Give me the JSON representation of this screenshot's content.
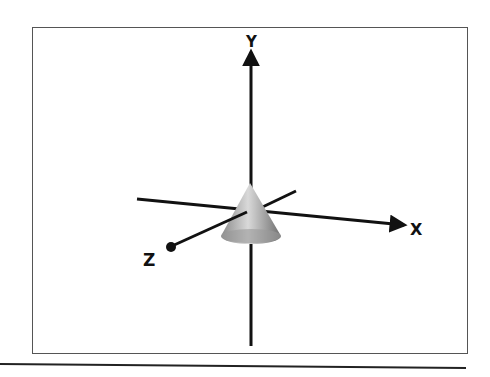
{
  "diagram": {
    "title": "",
    "axes": {
      "x": {
        "label": "X",
        "arrow": "right"
      },
      "y": {
        "label": "Y",
        "arrow": "up"
      },
      "z": {
        "label": "Z",
        "marker": "dot"
      }
    },
    "object": {
      "type": "cone",
      "shading": "gray-gradient",
      "position": "origin"
    },
    "colors": {
      "axis": "#111111",
      "frame": "#555555",
      "cone_light": "#d8d8d8",
      "cone_dark": "#7a7a7a"
    }
  }
}
